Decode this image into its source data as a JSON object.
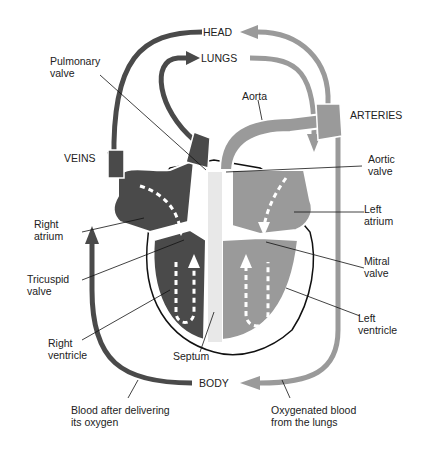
{
  "diagram": {
    "colors": {
      "deoxygenated": "#4a4a4a",
      "oxygenated": "#9a9a9a",
      "outline": "#111111",
      "background": "#ffffff"
    },
    "labels": {
      "head": "HEAD",
      "lungs": "LUNGS",
      "body": "BODY",
      "veins": "VEINS",
      "arteries": "ARTERIES",
      "pulmonary_valve": "Pulmonary\nvalve",
      "aorta": "Aorta",
      "aortic_valve": "Aortic\nvalve",
      "right_atrium": "Right\natrium",
      "left_atrium": "Left\natrium",
      "tricuspid_valve": "Tricuspid\nvalve",
      "mitral_valve": "Mitral\nvalve",
      "right_ventricle": "Right\nventricle",
      "left_ventricle": "Left\nventricle",
      "septum": "Septum",
      "deoxy_caption": "Blood after delivering\nits oxygen",
      "oxy_caption": "Oxygenated blood\nfrom the lungs"
    }
  }
}
